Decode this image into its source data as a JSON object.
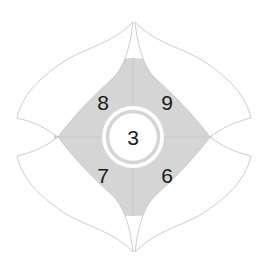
{
  "diagram": {
    "type": "flower-petal-quadrant-diagram",
    "center": {
      "label": "3",
      "cx": 133,
      "cy": 137,
      "inner_disc_radius": 22,
      "ring_outer_radius": 31,
      "ring_gap_radius": 25,
      "fill": "#ffffff",
      "text_color": "#1a1a1a"
    },
    "hub": {
      "cx": 133,
      "cy": 137,
      "radius": 79,
      "fill": "#d5d5d5",
      "divider_color": "#c9c9c9"
    },
    "quadrants": [
      {
        "name": "top-left",
        "label": "8",
        "x": 103,
        "y": 103
      },
      {
        "name": "top-right",
        "label": "9",
        "x": 167,
        "y": 103
      },
      {
        "name": "bottom-left",
        "label": "7",
        "x": 103,
        "y": 176
      },
      {
        "name": "bottom-right",
        "label": "6",
        "x": 167,
        "y": 176
      }
    ],
    "petals": [
      {
        "name": "petal-top-left",
        "fill": "#ffffff",
        "stroke": "#c6c6c6"
      },
      {
        "name": "petal-top-right",
        "fill": "#ffffff",
        "stroke": "#c6c6c6"
      },
      {
        "name": "petal-bottom-left",
        "fill": "#ffffff",
        "stroke": "#c6c6c6"
      },
      {
        "name": "petal-bottom-right",
        "fill": "#ffffff",
        "stroke": "#c6c6c6"
      }
    ],
    "colors": {
      "background": "#ffffff",
      "hub_gray": "#d5d5d5",
      "petal_outline": "#c6c6c6",
      "label_text": "#1a1a1a"
    }
  }
}
